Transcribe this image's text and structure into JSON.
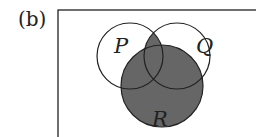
{
  "figure": {
    "tag": "(b)",
    "universe": {
      "x": 58,
      "y": 10,
      "width": 210,
      "height": 140
    },
    "sets": [
      {
        "name": "P",
        "cx": 130,
        "cy": 56,
        "r": 33,
        "label_x": 114,
        "label_y": 53
      },
      {
        "name": "Q",
        "cx": 177,
        "cy": 56,
        "r": 33,
        "label_x": 196,
        "label_y": 53
      },
      {
        "name": "R",
        "cx": 162,
        "cy": 86,
        "r": 41,
        "label_x": 152,
        "label_y": 126
      }
    ],
    "shaded_region": "(P ∩ Q) ∪ R",
    "colors": {
      "shade": "#666666",
      "stroke": "#222222",
      "background": "#ffffff"
    }
  }
}
